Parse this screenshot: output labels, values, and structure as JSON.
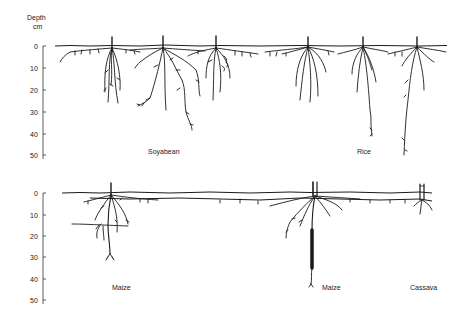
{
  "axis": {
    "title_line1": "Depth",
    "title_line2": "cm",
    "ticks": [
      "0",
      "10",
      "20",
      "30",
      "40",
      "50"
    ]
  },
  "panels": [
    {
      "id": "top",
      "crops": [
        {
          "label": "Soyabean",
          "plants": 3,
          "max_depth_cm": 38
        },
        {
          "label": "Rice",
          "plants": 3,
          "max_depth_cm": 52
        }
      ]
    },
    {
      "id": "bottom",
      "crops": [
        {
          "label": "Maize",
          "plants": 1,
          "max_depth_cm": 32
        },
        {
          "label": "Maize",
          "plants": 1,
          "max_depth_cm": 42
        },
        {
          "label": "Cassava",
          "plants": 1,
          "max_depth_cm": 10
        }
      ]
    }
  ],
  "labels": {
    "soyabean": "Soyabean",
    "rice": "Rice",
    "maize_left": "Maize",
    "maize_right": "Maize",
    "cassava": "Cassava"
  },
  "colors": {
    "ink": "#1a1a1a",
    "background": "#ffffff"
  }
}
